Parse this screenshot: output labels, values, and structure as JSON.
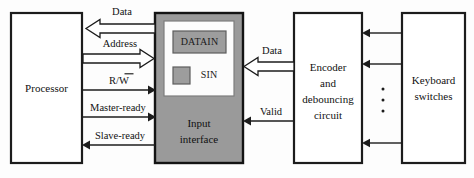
{
  "diagram": {
    "colors": {
      "interface_fill": "#9a9a9a",
      "register_fill": "#9d9d9d",
      "line": "#1c1c1c",
      "box_fill": "#ffffff"
    },
    "blocks": {
      "processor": {
        "label": "Processor"
      },
      "input_interface": {
        "label_line1": "Input",
        "label_line2": "interface",
        "registers": [
          {
            "name": "DATAIN",
            "label": "DATAIN"
          },
          {
            "name": "SIN",
            "label": "SIN"
          }
        ]
      },
      "encoder": {
        "label_line1": "Encoder",
        "label_line2": "and",
        "label_line3": "debouncing",
        "label_line4": "circuit"
      },
      "keyboard": {
        "label_line1": "Keyboard",
        "label_line2": "switches"
      }
    },
    "signals": {
      "data_bus_left": "Data",
      "address_bus": "Address",
      "read_write": "R/W",
      "read_write_overbar_char": "W",
      "master_ready": "Master-ready",
      "slave_ready": "Slave-ready",
      "data_bus_right": "Data",
      "valid": "Valid"
    },
    "vertical_ellipsis": "⋮"
  }
}
